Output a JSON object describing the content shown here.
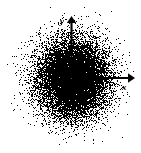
{
  "figure": {
    "name": "radial-point-density-scatter",
    "background_color": "#ffffff",
    "point_color": "#000000",
    "axis_color": "#000000",
    "margin_px": 7
  },
  "axes": {
    "x_axis": {
      "label": "x",
      "icon": "arrow-right-icon",
      "direction": "right",
      "origin_px": [
        72,
        78
      ],
      "tip_px": [
        134,
        78
      ]
    },
    "y_axis": {
      "label": "y",
      "icon": "arrow-up-icon",
      "direction": "up",
      "origin_px": [
        72,
        78
      ],
      "tip_px": [
        72,
        17
      ]
    }
  },
  "chart_data": {
    "type": "scatter",
    "title": "",
    "subtitle": "",
    "xlabel": "x",
    "ylabel": "y",
    "legend": [],
    "grid": false,
    "legend_position": "none",
    "xlim": [
      -3.6,
      3.6
    ],
    "ylim": [
      -3.6,
      3.6
    ],
    "origin": [
      0,
      0
    ],
    "distribution": "gaussian-2d-isotropic",
    "center": [
      0,
      0
    ],
    "sigma_x": 1.0,
    "sigma_y": 1.0,
    "n_points": 14000,
    "series": [
      {
        "name": "points",
        "color": "#000000",
        "marker": "pixel",
        "marker_size": 1,
        "density_profile": {
          "radius_units": [
            0.0,
            0.25,
            0.5,
            0.75,
            1.0,
            1.25,
            1.5,
            1.75,
            2.0,
            2.5,
            3.0,
            3.5
          ],
          "relative_density": [
            1.0,
            0.97,
            0.88,
            0.75,
            0.61,
            0.46,
            0.32,
            0.22,
            0.14,
            0.055,
            0.018,
            0.006
          ]
        }
      }
    ],
    "annotations": [
      {
        "text": "x",
        "style": "italic",
        "at": [
          3.2,
          -0.45
        ],
        "anchor": "x-axis-tip"
      },
      {
        "text": "y",
        "style": "italic",
        "at": [
          -0.45,
          3.2
        ],
        "anchor": "y-axis-tip"
      }
    ]
  }
}
